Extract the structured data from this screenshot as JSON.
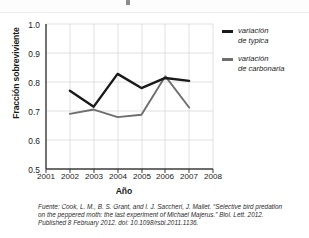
{
  "chart_data": {
    "type": "line",
    "title": "",
    "xlabel": "Año",
    "ylabel": "Fracción sobreviviente",
    "x": [
      2002,
      2003,
      2004,
      2005,
      2006,
      2007
    ],
    "xlim": [
      2001,
      2008
    ],
    "ylim": [
      0.5,
      1.0
    ],
    "xticks": [
      2001,
      2002,
      2003,
      2004,
      2005,
      2006,
      2007,
      2008
    ],
    "yticks": [
      0.5,
      0.6,
      0.7,
      0.8,
      0.9,
      1.0
    ],
    "grid": true,
    "legend_position": "right",
    "series": [
      {
        "name": "variación de typica",
        "color": "#1a1a1a",
        "values": [
          0.77,
          0.715,
          0.828,
          0.779,
          0.814,
          0.804
        ]
      },
      {
        "name": "variación de carbonaria",
        "color": "#6e6e6e",
        "values": [
          0.69,
          0.705,
          0.679,
          0.687,
          0.82,
          0.712
        ]
      }
    ]
  },
  "axes": {
    "y_tick_labels": [
      "1.0",
      "0.9",
      "0.8",
      "0.7",
      "0.6",
      "0.5"
    ],
    "x_tick_labels": [
      "2001",
      "2002",
      "2003",
      "2004",
      "2005",
      "2006",
      "2007",
      "2008"
    ],
    "y_title": "Fracción sobreviviente",
    "x_title": "Año"
  },
  "legend": {
    "items": [
      {
        "line1": "variación",
        "line2": "de typica",
        "color": "#1a1a1a"
      },
      {
        "line1": "variación",
        "line2": "de carbonaria",
        "color": "#6e6e6e"
      }
    ]
  },
  "caption": {
    "line1": "Fuente: Cook, L. M., B. S. Grant, and I. J. Saccheri, J. Mallet. “Selective bird predation",
    "line2": "on the peppered moth: the last experiment of Michael Majerus.” Biol. Lett. 2012.",
    "line3": "Published 8 February 2012. doi: 10.1098/rsbi.2011.1136."
  }
}
